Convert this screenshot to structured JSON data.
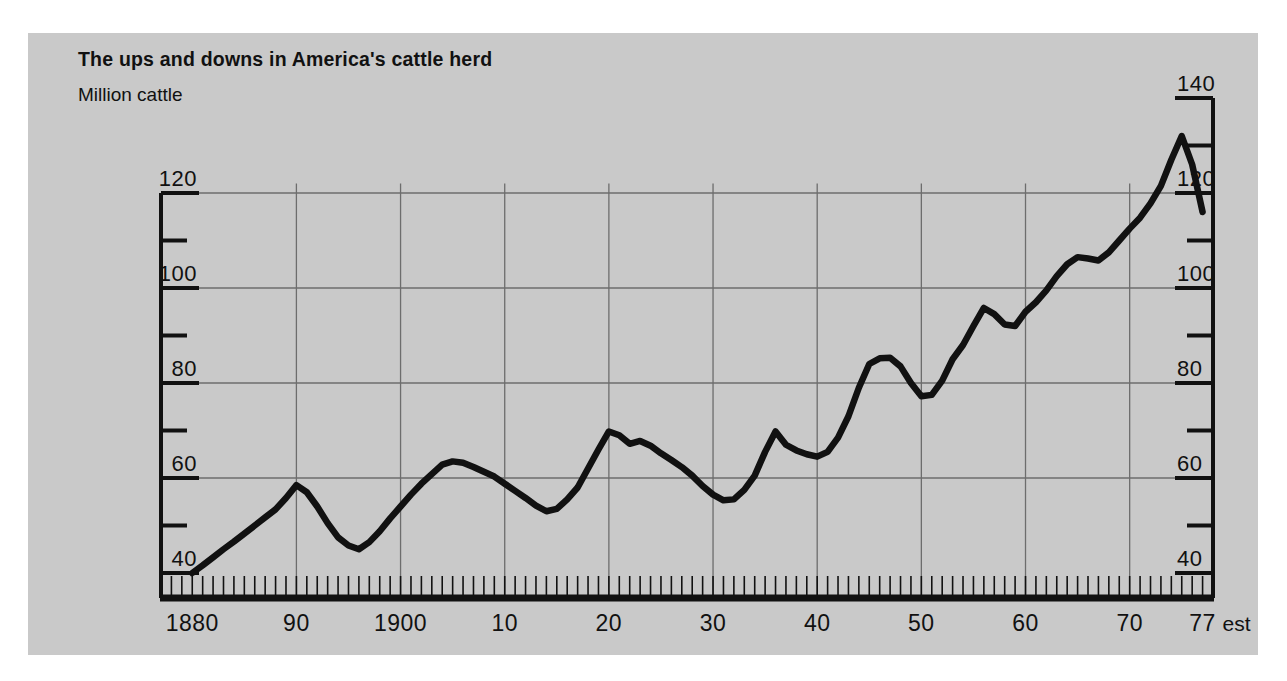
{
  "panel": {
    "background_color": "#c9c9c9",
    "page_background_color": "#ffffff"
  },
  "chart_data": {
    "type": "line",
    "title": "The ups and downs in America's cattle herd",
    "subtitle": "Million cattle",
    "ylabel": "Million cattle",
    "xlabel": "",
    "grid": true,
    "legend": null,
    "line_color": "#111111",
    "axis_color": "#111111",
    "grid_color": "#6d6d6d",
    "left_axis": {
      "ticks_major": [
        40,
        60,
        80,
        100,
        120
      ],
      "ticks_minor": [
        50,
        70,
        90,
        110
      ],
      "labels": [
        "40",
        "60",
        "80",
        "100",
        "120"
      ],
      "range": [
        34,
        140
      ]
    },
    "right_axis": {
      "ticks_major": [
        40,
        60,
        80,
        100,
        120,
        140
      ],
      "ticks_minor": [
        50,
        70,
        90,
        110,
        130
      ],
      "labels": [
        "40",
        "60",
        "80",
        "100",
        "120",
        "140"
      ],
      "range": [
        34,
        140
      ]
    },
    "xlim": [
      1877,
      1978
    ],
    "xtick_labels": [
      "1880",
      "90",
      "1900",
      "10",
      "20",
      "30",
      "40",
      "50",
      "60",
      "70",
      "77"
    ],
    "xtick_values": [
      1880,
      1890,
      1900,
      1910,
      1920,
      1930,
      1940,
      1950,
      1960,
      1970,
      1977
    ],
    "xtick_suffix": "est",
    "gridlines_horizontal": [
      60,
      80,
      100,
      120
    ],
    "gridlines_vertical": [
      1890,
      1900,
      1910,
      1920,
      1930,
      1940,
      1950,
      1960,
      1970
    ],
    "x": [
      1880,
      1881,
      1882,
      1883,
      1884,
      1885,
      1886,
      1887,
      1888,
      1889,
      1890,
      1891,
      1892,
      1893,
      1894,
      1895,
      1896,
      1897,
      1898,
      1899,
      1900,
      1901,
      1902,
      1903,
      1904,
      1905,
      1906,
      1907,
      1908,
      1909,
      1910,
      1911,
      1912,
      1913,
      1914,
      1915,
      1916,
      1917,
      1918,
      1919,
      1920,
      1921,
      1922,
      1923,
      1924,
      1925,
      1926,
      1927,
      1928,
      1929,
      1930,
      1931,
      1932,
      1933,
      1934,
      1935,
      1936,
      1937,
      1938,
      1939,
      1940,
      1941,
      1942,
      1943,
      1944,
      1945,
      1946,
      1947,
      1948,
      1949,
      1950,
      1951,
      1952,
      1953,
      1954,
      1955,
      1956,
      1957,
      1958,
      1959,
      1960,
      1961,
      1962,
      1963,
      1964,
      1965,
      1966,
      1967,
      1968,
      1969,
      1970,
      1971,
      1972,
      1973,
      1974,
      1975,
      1976,
      1977
    ],
    "values": [
      40.0,
      41.6,
      43.3,
      45.0,
      46.6,
      48.3,
      50.0,
      51.7,
      53.4,
      55.8,
      58.5,
      57.0,
      54.0,
      50.5,
      47.5,
      45.8,
      45.0,
      46.5,
      48.8,
      51.5,
      54.0,
      56.5,
      58.8,
      60.8,
      62.8,
      63.5,
      63.2,
      62.3,
      61.3,
      60.3,
      58.8,
      57.3,
      55.8,
      54.2,
      53.0,
      53.5,
      55.5,
      58.0,
      62.0,
      66.0,
      69.8,
      69.0,
      67.2,
      67.8,
      66.8,
      65.2,
      63.8,
      62.3,
      60.5,
      58.3,
      56.5,
      55.3,
      55.5,
      57.5,
      60.5,
      65.5,
      69.8,
      67.0,
      65.8,
      65.0,
      64.5,
      65.5,
      68.5,
      73.0,
      79.0,
      84.0,
      85.2,
      85.3,
      83.5,
      80.0,
      77.2,
      77.5,
      80.5,
      85.0,
      88.0,
      92.0,
      95.8,
      94.5,
      92.3,
      92.0,
      95.0,
      97.0,
      99.5,
      102.5,
      105.0,
      106.5,
      106.2,
      105.8,
      107.5,
      110.0,
      112.5,
      114.8,
      117.8,
      121.5,
      127.0,
      132.0,
      126.0,
      116.0
    ],
    "annotations": [
      {
        "text": "1977 figure is an estimate",
        "marker": "est"
      }
    ]
  },
  "axis_labels": {
    "left": [
      "120",
      "100",
      "80",
      "60",
      "40"
    ],
    "right": [
      "140",
      "120",
      "100",
      "80",
      "60",
      "40"
    ],
    "bottom": [
      "1880",
      "90",
      "1900",
      "10",
      "20",
      "30",
      "40",
      "50",
      "60",
      "70",
      "77"
    ],
    "est": "est"
  }
}
